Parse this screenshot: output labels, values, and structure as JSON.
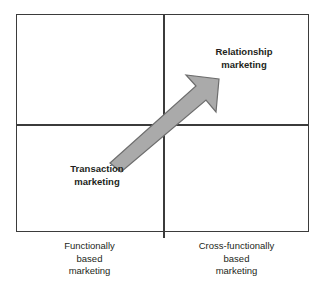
{
  "diagram": {
    "type": "2x2-matrix",
    "title": "",
    "colors": {
      "line": "#3b3b3b",
      "arrow_fill": "#aaaaaa",
      "arrow_stroke": "#6d6d6d",
      "text": "#231f20",
      "background": "#ffffff"
    },
    "quadrant_labels": [
      {
        "name": "relationship-marketing",
        "text": "Relationship\nmarketing",
        "quadrant": "top-right",
        "bold": true
      },
      {
        "name": "transaction-marketing",
        "text": "Transaction\nmarketing",
        "quadrant": "bottom-left",
        "bold": true
      }
    ],
    "axis_captions": [
      {
        "name": "functionally-based-marketing",
        "text": "Functionally\nbased\nmarketing",
        "position": "bottom-left",
        "bold": false
      },
      {
        "name": "cross-functionally-based-marketing",
        "text": "Cross-functionally\nbased\nmarketing",
        "position": "bottom-right",
        "bold": false
      }
    ],
    "arrow": {
      "name": "progression-arrow",
      "direction": "lower-left-to-upper-right",
      "from_label": "Transaction marketing",
      "to_label": "Relationship marketing"
    }
  }
}
